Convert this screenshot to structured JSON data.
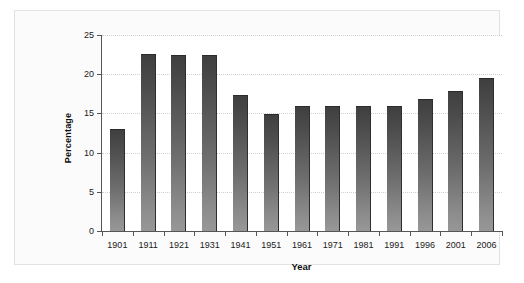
{
  "chart_data": {
    "type": "bar",
    "title": "",
    "subtitle": "",
    "xlabel": "Year",
    "ylabel": "Percentage",
    "categories": [
      "1901",
      "1911",
      "1921",
      "1931",
      "1941",
      "1951",
      "1961",
      "1971",
      "1981",
      "1991",
      "1996",
      "2001",
      "2006"
    ],
    "values": [
      13.0,
      22.6,
      22.5,
      22.5,
      17.3,
      14.9,
      15.9,
      15.9,
      15.9,
      15.9,
      16.8,
      17.8,
      19.5
    ],
    "series": [
      {
        "name": "Percentage",
        "values": [
          13.0,
          22.6,
          22.5,
          22.5,
          17.3,
          14.9,
          15.9,
          15.9,
          15.9,
          15.9,
          16.8,
          17.8,
          19.5
        ]
      }
    ],
    "ylim": [
      0,
      25
    ],
    "yticks": [
      0,
      5,
      10,
      15,
      20,
      25
    ],
    "ytick_labels": [
      "0",
      "5",
      "10",
      "15",
      "20",
      "25"
    ],
    "grid": "horizontal-dotted",
    "legend": "none",
    "bar_color": "#5f5f5f",
    "axis_color": "#555555",
    "grid_color": "#cfcfcf",
    "background": "#ffffff",
    "frame_color": "#e2e2e2"
  }
}
